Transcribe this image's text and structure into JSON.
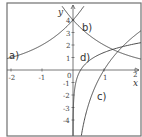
{
  "chart_data": {
    "type": "line",
    "title": "",
    "xlabel": "x",
    "ylabel": "y",
    "xlim": [
      -2.13,
      2.19
    ],
    "ylim": [
      -5.3,
      5.35
    ],
    "grid": false,
    "legend": "inline labels",
    "x_ticks": [
      -2,
      -1,
      0,
      1,
      2
    ],
    "x_tick_labels": [
      "-2",
      "-1",
      "0",
      "1",
      "2"
    ],
    "y_ticks": [
      -4,
      -3,
      -2,
      -1,
      1,
      2,
      3,
      4
    ],
    "y_tick_labels": [
      "-4",
      "-3",
      "-2",
      "-1",
      "1",
      "2",
      "3",
      "4"
    ],
    "series": [
      {
        "name": "a)",
        "formula": "4*2^x",
        "x": [
          -2.13,
          -2,
          -1.5,
          -1,
          -0.5,
          0,
          0.3
        ],
        "y": [
          0.91,
          1,
          1.41,
          2,
          2.83,
          4,
          4.92
        ]
      },
      {
        "name": "b)",
        "formula": "4*2^(-x)",
        "x": [
          -0.3,
          0,
          0.5,
          1,
          1.5,
          2,
          2.19
        ],
        "y": [
          4.92,
          4,
          2.83,
          2,
          1.41,
          1,
          0.88
        ]
      },
      {
        "name": "c)",
        "formula": "4*ln(x)",
        "x": [
          0.27,
          0.5,
          1,
          1.5,
          2,
          2.19
        ],
        "y": [
          -5.24,
          -2.77,
          0,
          1.62,
          2.77,
          3.14
        ]
      },
      {
        "name": "d)",
        "formula": "ln(x)+1.4",
        "x": [
          0.0013,
          0.05,
          0.25,
          0.5,
          1,
          1.5,
          2,
          2.19
        ],
        "y": [
          -5.24,
          -1.6,
          0.01,
          0.71,
          1.4,
          1.81,
          2.09,
          2.18
        ]
      }
    ],
    "annotations": [
      {
        "text": "a)",
        "x": -2.0,
        "y": 1.3
      },
      {
        "text": "b)",
        "x": 0.3,
        "y": 3.3
      },
      {
        "text": "c)",
        "x": 0.8,
        "y": -2.4
      },
      {
        "text": "d)",
        "x": 0.3,
        "y": 0.8
      }
    ]
  },
  "labels": {
    "x_axis": "x",
    "y_axis": "y",
    "curve_a": "a)",
    "curve_b": "b)",
    "curve_c": "c)",
    "curve_d": "d)",
    "xt_m2": "-2",
    "xt_m1": "-1",
    "xt_0": "0",
    "xt_1": "1",
    "xt_2": "2",
    "yt_4": "4",
    "yt_3": "3",
    "yt_2": "2",
    "yt_1": "1",
    "yt_m1": "-1",
    "yt_m2": "-2",
    "yt_m3": "-3",
    "yt_m4": "-4"
  }
}
